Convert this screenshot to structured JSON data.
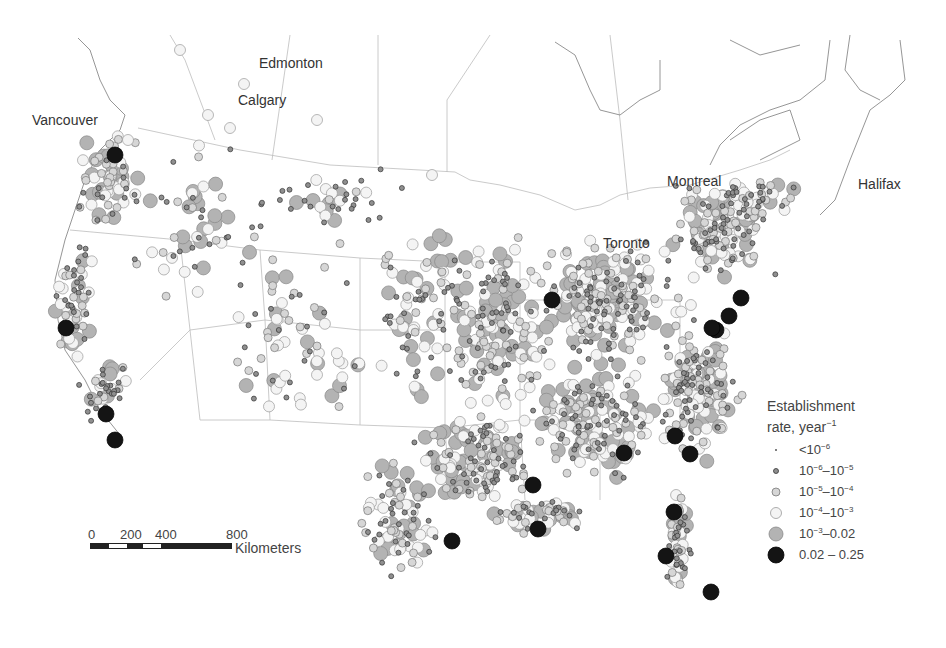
{
  "map": {
    "title": "Establishment rate map",
    "background": "#ffffff",
    "border_color": "#bdbdbd",
    "coast_color": "#8a8a8a"
  },
  "city_labels": [
    {
      "name": "Edmonton",
      "x": 259,
      "y": 56
    },
    {
      "name": "Calgary",
      "x": 238,
      "y": 93
    },
    {
      "name": "Vancouver",
      "x": 32,
      "y": 113
    },
    {
      "name": "Montreal",
      "x": 667,
      "y": 174
    },
    {
      "name": "Toronto",
      "x": 603,
      "y": 236
    },
    {
      "name": "Halifax",
      "x": 858,
      "y": 177
    }
  ],
  "legend": {
    "title_line1": "Establishment",
    "title_line2": "rate, year",
    "title_exp": "−1",
    "classes": [
      {
        "label_base": "<10",
        "label_exp": "−6",
        "label_tail": "",
        "tail_exp": "",
        "radius": 1,
        "fill": "#555555",
        "stroke": "#555555"
      },
      {
        "label_base": "10",
        "label_exp": "−6",
        "label_tail": "–10",
        "tail_exp": "−5",
        "radius": 2.5,
        "fill": "#8f8f8f",
        "stroke": "#333333"
      },
      {
        "label_base": "10",
        "label_exp": "−5",
        "label_tail": "–10",
        "tail_exp": "−4",
        "radius": 4,
        "fill": "#d6d6d6",
        "stroke": "#777777"
      },
      {
        "label_base": "10",
        "label_exp": "−4",
        "label_tail": "–10",
        "tail_exp": "−3",
        "radius": 5.5,
        "fill": "#f4f4f4",
        "stroke": "#999999"
      },
      {
        "label_base": "10",
        "label_exp": "−3",
        "label_tail": "–0.02",
        "tail_exp": "",
        "radius": 7,
        "fill": "#b3b3b3",
        "stroke": "#888888"
      },
      {
        "label_base": "0.02 – 0.25",
        "label_exp": "",
        "label_tail": "",
        "tail_exp": "",
        "radius": 8,
        "fill": "#141414",
        "stroke": "#000000"
      }
    ]
  },
  "scale_bar": {
    "ticks": [
      "0",
      "200",
      "400",
      "800"
    ],
    "tick_x": [
      0,
      36,
      71,
      142
    ],
    "units": "Kilometers",
    "segments": [
      "#222222",
      "#ffffff",
      "#222222",
      "#ffffff",
      "#222222"
    ],
    "segment_widths": [
      18,
      18,
      17,
      18,
      71
    ]
  },
  "high_sites": [
    {
      "x": 115,
      "y": 155
    },
    {
      "x": 66,
      "y": 328
    },
    {
      "x": 106,
      "y": 414
    },
    {
      "x": 115,
      "y": 440
    },
    {
      "x": 552,
      "y": 300
    },
    {
      "x": 741,
      "y": 298
    },
    {
      "x": 729,
      "y": 316
    },
    {
      "x": 716,
      "y": 330
    },
    {
      "x": 712,
      "y": 328
    },
    {
      "x": 675,
      "y": 436
    },
    {
      "x": 690,
      "y": 454
    },
    {
      "x": 624,
      "y": 453
    },
    {
      "x": 533,
      "y": 485
    },
    {
      "x": 538,
      "y": 529
    },
    {
      "x": 452,
      "y": 541
    },
    {
      "x": 674,
      "y": 512
    },
    {
      "x": 666,
      "y": 556
    },
    {
      "x": 711,
      "y": 592
    }
  ],
  "clusters": [
    {
      "x": 110,
      "y": 180,
      "rx": 40,
      "ry": 60,
      "n": 70
    },
    {
      "x": 75,
      "y": 300,
      "rx": 22,
      "ry": 70,
      "n": 60
    },
    {
      "x": 105,
      "y": 390,
      "rx": 30,
      "ry": 40,
      "n": 40
    },
    {
      "x": 200,
      "y": 230,
      "rx": 90,
      "ry": 100,
      "n": 60
    },
    {
      "x": 300,
      "y": 340,
      "rx": 90,
      "ry": 120,
      "n": 70
    },
    {
      "x": 420,
      "y": 300,
      "rx": 70,
      "ry": 120,
      "n": 90
    },
    {
      "x": 500,
      "y": 330,
      "rx": 70,
      "ry": 110,
      "n": 160
    },
    {
      "x": 610,
      "y": 300,
      "rx": 90,
      "ry": 80,
      "n": 230
    },
    {
      "x": 720,
      "y": 230,
      "rx": 60,
      "ry": 60,
      "n": 150
    },
    {
      "x": 700,
      "y": 390,
      "rx": 50,
      "ry": 80,
      "n": 160
    },
    {
      "x": 600,
      "y": 420,
      "rx": 80,
      "ry": 70,
      "n": 180
    },
    {
      "x": 480,
      "y": 460,
      "rx": 80,
      "ry": 60,
      "n": 150
    },
    {
      "x": 400,
      "y": 520,
      "rx": 50,
      "ry": 70,
      "n": 90
    },
    {
      "x": 540,
      "y": 515,
      "rx": 70,
      "ry": 20,
      "n": 60
    },
    {
      "x": 680,
      "y": 540,
      "rx": 20,
      "ry": 60,
      "n": 60
    },
    {
      "x": 760,
      "y": 200,
      "rx": 50,
      "ry": 30,
      "n": 40
    },
    {
      "x": 330,
      "y": 200,
      "rx": 120,
      "ry": 40,
      "n": 40
    }
  ]
}
